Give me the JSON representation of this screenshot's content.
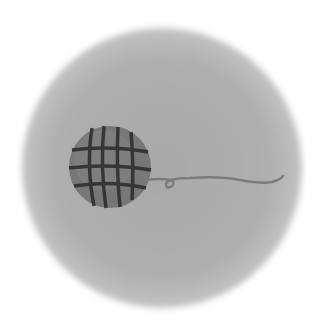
{
  "image": {
    "description": "Ball of yarn with trailing thread on soft gray circle",
    "colors": {
      "background": "#ffffff",
      "circle": "#aeaeae",
      "ball_fill": "#7a7a7a",
      "ball_stripes": "#2e2e2e",
      "thread": "#808080"
    }
  }
}
